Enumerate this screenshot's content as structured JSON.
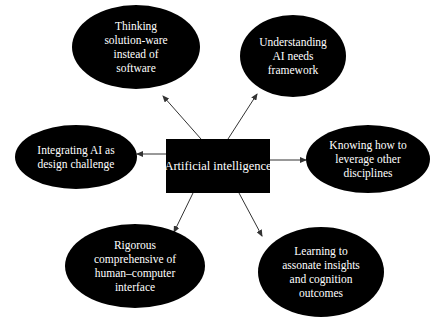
{
  "diagram": {
    "type": "mind-map",
    "colors": {
      "background": "#ffffff",
      "node_fill": "#000000",
      "node_text": "#ffffff",
      "arrow": "#333333"
    },
    "center": {
      "label": "Artificial intelligence",
      "shape": "rectangle",
      "x": 166,
      "y": 139,
      "w": 104,
      "h": 54
    },
    "nodes": [
      {
        "id": "thinking",
        "lines": [
          "Thinking",
          "solution-ware",
          "instead of",
          "software"
        ],
        "shape": "ellipse",
        "cx": 136,
        "cy": 47,
        "rx": 64,
        "ry": 42
      },
      {
        "id": "understanding",
        "lines": [
          "Understanding",
          "AI needs",
          "framework"
        ],
        "shape": "ellipse",
        "cx": 293,
        "cy": 56,
        "rx": 53,
        "ry": 41
      },
      {
        "id": "integrating",
        "lines": [
          "Integrating AI as",
          "design challenge"
        ],
        "shape": "ellipse",
        "cx": 76,
        "cy": 157,
        "rx": 61,
        "ry": 32
      },
      {
        "id": "knowing",
        "lines": [
          "Knowing how to",
          "leverage other",
          "disciplines"
        ],
        "shape": "ellipse",
        "cx": 368,
        "cy": 159,
        "rx": 62,
        "ry": 34
      },
      {
        "id": "rigorous",
        "lines": [
          "Rigorous",
          "comprehensive of",
          "human–computer",
          "interface"
        ],
        "shape": "ellipse",
        "cx": 135,
        "cy": 266,
        "rx": 70,
        "ry": 42
      },
      {
        "id": "learning",
        "lines": [
          "Learning to",
          "assonate insights",
          "and cognition",
          "outcomes"
        ],
        "shape": "ellipse",
        "cx": 321,
        "cy": 272,
        "rx": 63,
        "ry": 45
      }
    ],
    "edges": [
      {
        "from": "center",
        "to": "thinking",
        "x1": 201,
        "y1": 139,
        "x2": 163,
        "y2": 96
      },
      {
        "from": "center",
        "to": "understanding",
        "x1": 228,
        "y1": 139,
        "x2": 257,
        "y2": 94
      },
      {
        "from": "center",
        "to": "integrating",
        "x1": 166,
        "y1": 154,
        "x2": 137,
        "y2": 154
      },
      {
        "from": "center",
        "to": "knowing",
        "x1": 270,
        "y1": 160,
        "x2": 306,
        "y2": 160
      },
      {
        "from": "center",
        "to": "rigorous",
        "x1": 193,
        "y1": 193,
        "x2": 174,
        "y2": 232
      },
      {
        "from": "center",
        "to": "learning",
        "x1": 239,
        "y1": 193,
        "x2": 262,
        "y2": 236
      }
    ]
  }
}
